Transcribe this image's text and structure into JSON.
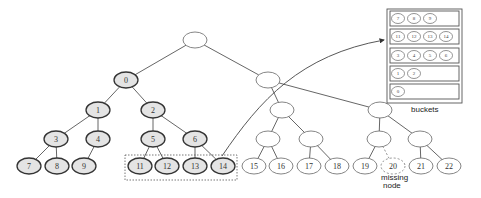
{
  "diagram": {
    "title": "",
    "nodes": [
      {
        "id": "root",
        "label": "",
        "style": "empty"
      },
      {
        "id": "n0",
        "label": "0",
        "style": "filled"
      },
      {
        "id": "n1",
        "label": "1",
        "style": "filled"
      },
      {
        "id": "n2",
        "label": "2",
        "style": "filled"
      },
      {
        "id": "n3",
        "label": "3",
        "style": "filled"
      },
      {
        "id": "n4",
        "label": "4",
        "style": "filled"
      },
      {
        "id": "n5",
        "label": "5",
        "style": "filled"
      },
      {
        "id": "n6",
        "label": "6",
        "style": "filled"
      },
      {
        "id": "n7",
        "label": "7",
        "style": "filled"
      },
      {
        "id": "n8",
        "label": "8",
        "style": "filled"
      },
      {
        "id": "n9",
        "label": "9",
        "style": "filled"
      },
      {
        "id": "n11",
        "label": "11",
        "style": "filled"
      },
      {
        "id": "n12",
        "label": "12",
        "style": "filled"
      },
      {
        "id": "n13",
        "label": "13",
        "style": "filled"
      },
      {
        "id": "n14",
        "label": "14",
        "style": "filled"
      },
      {
        "id": "a",
        "label": "",
        "style": "empty"
      },
      {
        "id": "b",
        "label": "",
        "style": "empty"
      },
      {
        "id": "c",
        "label": "",
        "style": "empty"
      },
      {
        "id": "d",
        "label": "",
        "style": "empty"
      },
      {
        "id": "e",
        "label": "",
        "style": "empty"
      },
      {
        "id": "f",
        "label": "",
        "style": "empty"
      },
      {
        "id": "g",
        "label": "",
        "style": "empty"
      },
      {
        "id": "n15",
        "label": "15",
        "style": "empty"
      },
      {
        "id": "n16",
        "label": "16",
        "style": "empty"
      },
      {
        "id": "n17",
        "label": "17",
        "style": "empty"
      },
      {
        "id": "n18",
        "label": "18",
        "style": "empty"
      },
      {
        "id": "n19",
        "label": "19",
        "style": "empty"
      },
      {
        "id": "n20",
        "label": "20",
        "style": "missing"
      },
      {
        "id": "n21",
        "label": "21",
        "style": "empty"
      },
      {
        "id": "n22",
        "label": "22",
        "style": "empty"
      }
    ],
    "edges": [
      [
        "root",
        "n0"
      ],
      [
        "root",
        "a"
      ],
      [
        "n0",
        "n1"
      ],
      [
        "n0",
        "n2"
      ],
      [
        "n1",
        "n3"
      ],
      [
        "n1",
        "n4"
      ],
      [
        "n2",
        "n5"
      ],
      [
        "n2",
        "n6"
      ],
      [
        "n3",
        "n7"
      ],
      [
        "n3",
        "n8"
      ],
      [
        "n4",
        "n9"
      ],
      [
        "n5",
        "n11"
      ],
      [
        "n5",
        "n12"
      ],
      [
        "n6",
        "n13"
      ],
      [
        "n6",
        "n14"
      ],
      [
        "a",
        "b"
      ],
      [
        "a",
        "e"
      ],
      [
        "b",
        "c"
      ],
      [
        "b",
        "d"
      ],
      [
        "c",
        "n15"
      ],
      [
        "c",
        "n16"
      ],
      [
        "d",
        "n17"
      ],
      [
        "d",
        "n18"
      ],
      [
        "e",
        "f"
      ],
      [
        "e",
        "g"
      ],
      [
        "f",
        "n19"
      ],
      [
        "g",
        "n21"
      ],
      [
        "g",
        "n22"
      ]
    ],
    "dashed_edges": [
      [
        "f",
        "n20"
      ]
    ],
    "selection": [
      "n11",
      "n12",
      "n13",
      "n14"
    ],
    "buckets": {
      "caption": "buckets",
      "rows": [
        [
          "7",
          "8",
          "9"
        ],
        [
          "11",
          "12",
          "13",
          "14"
        ],
        [
          "3",
          "4",
          "5",
          "6"
        ],
        [
          "1",
          "2"
        ],
        [
          "0"
        ]
      ]
    },
    "missing_label_line1": "missing",
    "missing_label_line2": "node"
  }
}
